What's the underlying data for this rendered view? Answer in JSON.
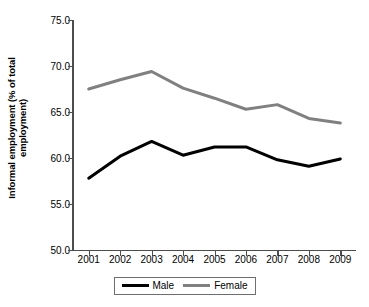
{
  "chart_data": {
    "type": "line",
    "title": "",
    "subtitle": "",
    "xlabel": "",
    "ylabel": "Informal employment (% of total employment)",
    "ylabel_line1": "Informal employment (% of total",
    "ylabel_line2": "employment)",
    "categories": [
      "2001",
      "2002",
      "2003",
      "2004",
      "2005",
      "2006",
      "2007",
      "2008",
      "2009"
    ],
    "x": [
      2001,
      2002,
      2003,
      2004,
      2005,
      2006,
      2007,
      2008,
      2009
    ],
    "ylim": [
      50.0,
      75.0
    ],
    "ytick_labels": [
      "75.0",
      "70.0",
      "65.0",
      "60.0",
      "55.0",
      "50.0"
    ],
    "ytick_values": [
      75.0,
      70.0,
      65.0,
      60.0,
      55.0,
      50.0
    ],
    "grid": false,
    "legend_position": "bottom-center",
    "series": [
      {
        "name": "Male",
        "color": "#000000",
        "line_width": 3,
        "values": [
          57.8,
          60.2,
          61.8,
          60.3,
          61.2,
          61.2,
          59.8,
          59.1,
          59.9
        ]
      },
      {
        "name": "Female",
        "color": "#808080",
        "line_width": 3,
        "values": [
          67.5,
          68.5,
          69.4,
          67.6,
          66.5,
          65.3,
          65.8,
          64.3,
          63.8
        ]
      }
    ],
    "legend": [
      {
        "label": "Male",
        "color": "#000000"
      },
      {
        "label": "Female",
        "color": "#808080"
      }
    ],
    "axis_color": "#4d4d4d"
  }
}
